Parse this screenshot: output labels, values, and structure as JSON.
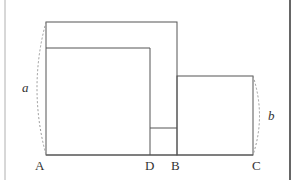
{
  "diagram": {
    "type": "geometry-figure",
    "colors": {
      "stroke": "#555555",
      "dashed": "#999999",
      "left_border": "#b0b0b0",
      "right_border": "#333333",
      "text": "#333333"
    },
    "points": {
      "A": {
        "label": "A"
      },
      "D": {
        "label": "D"
      },
      "B": {
        "label": "B"
      },
      "C": {
        "label": "C"
      }
    },
    "dimensions": {
      "a": {
        "label": "a"
      },
      "b": {
        "label": "b"
      }
    }
  }
}
